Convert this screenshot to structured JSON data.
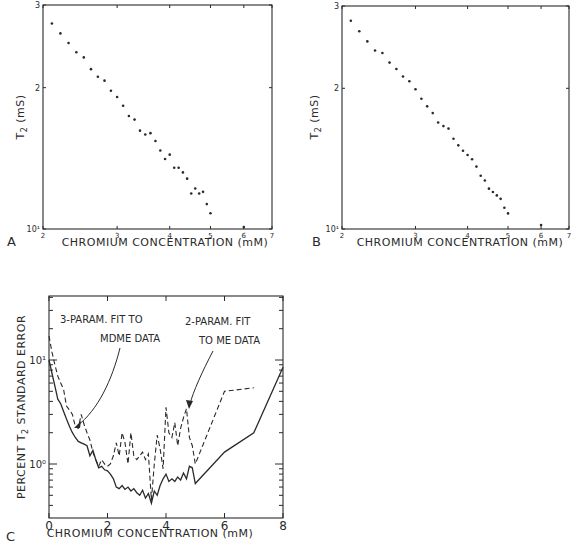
{
  "figure": {
    "panels": [
      "A",
      "B",
      "C"
    ]
  },
  "chart_data": [
    {
      "panel": "A",
      "type": "scatter",
      "xscale": "log",
      "yscale": "log",
      "xlabel": "CHROMIUM CONCENTRATION (mM)",
      "ylabel": "T2 (mS)",
      "xlim": [
        2,
        7
      ],
      "ylim": [
        10,
        30
      ],
      "xticks": [
        "2",
        "3",
        "4",
        "5",
        "6",
        "7"
      ],
      "yticks": [
        "10¹",
        "2",
        "3"
      ],
      "grid": false,
      "x": [
        2.1,
        2.2,
        2.3,
        2.4,
        2.5,
        2.6,
        2.7,
        2.8,
        2.9,
        3.0,
        3.1,
        3.2,
        3.3,
        3.4,
        3.5,
        3.6,
        3.7,
        3.8,
        3.9,
        4.0,
        4.1,
        4.2,
        4.3,
        4.4,
        4.5,
        4.6,
        4.7,
        4.8,
        4.9,
        5.0,
        6.0
      ],
      "y": [
        27.4,
        26.1,
        24.9,
        23.8,
        23.2,
        21.9,
        21.1,
        20.7,
        19.7,
        19.1,
        18.3,
        17.4,
        17.1,
        16.2,
        15.9,
        16.0,
        15.4,
        14.7,
        14.1,
        14.4,
        13.5,
        13.5,
        13.2,
        12.8,
        11.9,
        12.2,
        11.9,
        12.0,
        11.3,
        10.8,
        10.1
      ]
    },
    {
      "panel": "B",
      "type": "scatter",
      "xscale": "log",
      "yscale": "log",
      "xlabel": "CHROMIUM CONCENTRATION (mM)",
      "ylabel": "T2 (mS)",
      "xlim": [
        2,
        7
      ],
      "ylim": [
        10,
        30
      ],
      "xticks": [
        "2",
        "3",
        "4",
        "5",
        "6",
        "7"
      ],
      "yticks": [
        "10¹",
        "2",
        "3"
      ],
      "grid": false,
      "x": [
        2.1,
        2.2,
        2.3,
        2.4,
        2.5,
        2.6,
        2.7,
        2.8,
        2.9,
        3.0,
        3.1,
        3.2,
        3.3,
        3.4,
        3.5,
        3.6,
        3.7,
        3.8,
        3.9,
        4.0,
        4.1,
        4.2,
        4.3,
        4.4,
        4.5,
        4.6,
        4.7,
        4.8,
        4.9,
        5.0,
        6.0
      ],
      "y": [
        27.9,
        26.5,
        25.2,
        24.1,
        23.8,
        22.7,
        22.0,
        21.2,
        20.7,
        19.9,
        19.0,
        18.3,
        17.7,
        16.9,
        16.6,
        16.4,
        15.6,
        15.1,
        14.7,
        14.4,
        14.1,
        13.6,
        13.0,
        12.7,
        12.2,
        12.0,
        11.8,
        11.6,
        11.1,
        10.8,
        10.2
      ]
    },
    {
      "panel": "C",
      "type": "line",
      "xscale": "linear",
      "yscale": "log",
      "xlabel": "CHROMIUM CONCENTRATION (mM)",
      "ylabel": "PERCENT T2 STANDARD ERROR",
      "xlim": [
        0,
        8
      ],
      "ylim": [
        0.3,
        25
      ],
      "xticks": [
        "0",
        "2",
        "4",
        "6",
        "8"
      ],
      "yticks": [
        "10⁰",
        "10¹"
      ],
      "grid": false,
      "annotations": [
        {
          "text_lines": [
            "3-PARAM. FIT TO",
            "MDME DATA"
          ],
          "points_to": "solid"
        },
        {
          "text_lines": [
            "2-PARAM. FIT",
            "TO ME DATA"
          ],
          "points_to": "dashed"
        }
      ],
      "series": [
        {
          "name": "3-PARAM. FIT TO MDME DATA",
          "style": "solid",
          "x": [
            0,
            0.1,
            0.2,
            0.3,
            0.4,
            0.5,
            0.6,
            0.7,
            0.8,
            0.9,
            1.0,
            1.1,
            1.2,
            1.3,
            1.4,
            1.5,
            1.6,
            1.7,
            1.8,
            1.9,
            2.0,
            2.1,
            2.2,
            2.3,
            2.4,
            2.5,
            2.6,
            2.7,
            2.8,
            2.9,
            3.0,
            3.1,
            3.2,
            3.3,
            3.4,
            3.5,
            3.6,
            3.7,
            3.8,
            3.9,
            4.0,
            4.1,
            4.2,
            4.3,
            4.4,
            4.5,
            4.6,
            4.7,
            4.8,
            4.9,
            5.0,
            6.0,
            7.0,
            8.0
          ],
          "y": [
            10.0,
            7.5,
            5.6,
            4.2,
            3.8,
            3.2,
            2.7,
            2.3,
            2.0,
            1.8,
            1.65,
            1.6,
            1.55,
            1.5,
            1.2,
            1.35,
            1.1,
            0.92,
            0.95,
            0.88,
            0.86,
            0.8,
            0.72,
            0.6,
            0.58,
            0.62,
            0.57,
            0.6,
            0.55,
            0.58,
            0.53,
            0.5,
            0.56,
            0.47,
            0.52,
            0.42,
            0.55,
            0.5,
            0.62,
            0.72,
            0.8,
            0.68,
            0.72,
            0.68,
            0.75,
            0.7,
            0.82,
            0.72,
            0.95,
            0.92,
            0.65,
            1.3,
            2.0,
            8.5
          ]
        },
        {
          "name": "2-PARAM. FIT TO ME DATA",
          "style": "dashed",
          "x": [
            0,
            0.1,
            0.2,
            0.3,
            0.4,
            0.5,
            0.6,
            0.7,
            0.8,
            0.9,
            1.0,
            1.1,
            1.2,
            1.3,
            1.4,
            1.5,
            1.6,
            1.7,
            1.8,
            1.9,
            2.0,
            2.1,
            2.2,
            2.3,
            2.4,
            2.5,
            2.6,
            2.7,
            2.8,
            2.9,
            3.0,
            3.1,
            3.2,
            3.3,
            3.4,
            3.5,
            3.6,
            3.7,
            3.8,
            3.9,
            4.0,
            4.1,
            4.2,
            4.3,
            4.4,
            4.5,
            4.6,
            4.7,
            4.8,
            4.9,
            5.0,
            6.0,
            7.0
          ],
          "y": [
            17.0,
            12.0,
            9.0,
            7.0,
            6.0,
            5.2,
            3.6,
            3.3,
            3.0,
            2.3,
            2.2,
            3.0,
            2.4,
            2.0,
            1.7,
            1.3,
            1.1,
            0.95,
            1.1,
            1.0,
            0.95,
            1.0,
            1.2,
            1.6,
            1.2,
            2.0,
            1.6,
            1.0,
            2.0,
            1.2,
            1.1,
            1.2,
            1.3,
            1.1,
            1.25,
            0.45,
            1.0,
            1.9,
            1.4,
            0.9,
            3.5,
            2.0,
            1.8,
            2.5,
            1.5,
            2.2,
            2.8,
            3.4,
            1.8,
            1.5,
            1.0,
            5.0,
            5.4
          ]
        }
      ]
    }
  ]
}
